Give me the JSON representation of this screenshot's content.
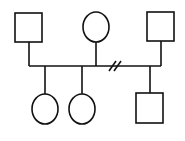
{
  "diagram": {
    "type": "pedigree",
    "colors": {
      "stroke": "#111111",
      "background": "#ffffff"
    },
    "individuals": [
      {
        "id": "father",
        "sex": "male",
        "shape": "square",
        "generation": 1
      },
      {
        "id": "mother",
        "sex": "female",
        "shape": "circle",
        "generation": 1
      },
      {
        "id": "second-partner",
        "sex": "male",
        "shape": "square",
        "generation": 1
      },
      {
        "id": "daughter-1",
        "sex": "female",
        "shape": "circle",
        "generation": 2
      },
      {
        "id": "daughter-2",
        "sex": "female",
        "shape": "circle",
        "generation": 2
      },
      {
        "id": "son",
        "sex": "male",
        "shape": "square",
        "generation": 2
      }
    ],
    "relationships": [
      {
        "partners": [
          "father",
          "mother"
        ],
        "status": "mating",
        "children": [
          "daughter-1",
          "daughter-2"
        ]
      },
      {
        "partners": [
          "mother",
          "second-partner"
        ],
        "status": "separated (double slash)",
        "children": [
          "son"
        ]
      }
    ]
  }
}
